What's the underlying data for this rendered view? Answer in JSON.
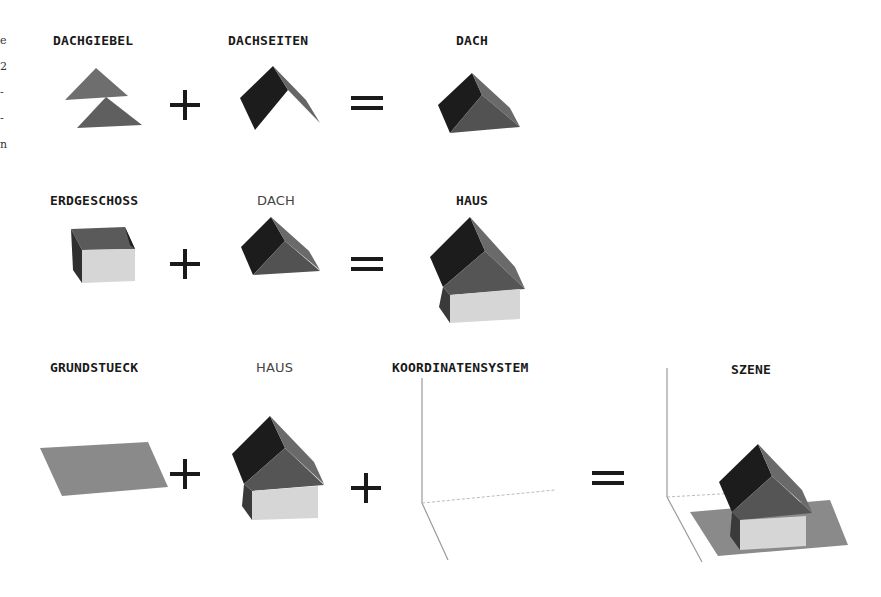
{
  "margin_fragments": [
    "e",
    "2",
    "-",
    "-",
    "n"
  ],
  "rows": [
    {
      "items": [
        {
          "label": "DACHGIEBEL",
          "style": "bold",
          "shape": "gable-triangles"
        },
        {
          "operator": "+"
        },
        {
          "label": "DACHSEITEN",
          "style": "bold",
          "shape": "roof-sides"
        },
        {
          "operator": "="
        },
        {
          "label": "DACH",
          "style": "bold",
          "shape": "roof"
        }
      ]
    },
    {
      "items": [
        {
          "label": "ERDGESCHOSS",
          "style": "bold",
          "shape": "ground-floor-box"
        },
        {
          "operator": "+"
        },
        {
          "label": "DACH",
          "style": "light",
          "shape": "roof"
        },
        {
          "operator": "="
        },
        {
          "label": "HAUS",
          "style": "bold",
          "shape": "house"
        }
      ]
    },
    {
      "items": [
        {
          "label": "GRUNDSTUECK",
          "style": "bold",
          "shape": "plot-plane"
        },
        {
          "operator": "+"
        },
        {
          "label": "HAUS",
          "style": "light",
          "shape": "house"
        },
        {
          "operator": "+"
        },
        {
          "label": "KOORDINATENSYSTEM",
          "style": "bold",
          "shape": "coordinate-axes"
        },
        {
          "operator": "="
        },
        {
          "label": "SZENE",
          "style": "bold",
          "shape": "scene"
        }
      ]
    }
  ],
  "colors": {
    "dark_face": "#1c1c1c",
    "mid_face": "#5a5a5a",
    "gable": "#6e6e6e",
    "wall_light": "#d6d6d6",
    "wall_dark": "#3a3a3a",
    "plot": "#8a8a8a",
    "axis": "#9a9a9a",
    "operator": "#1a1a1a"
  }
}
